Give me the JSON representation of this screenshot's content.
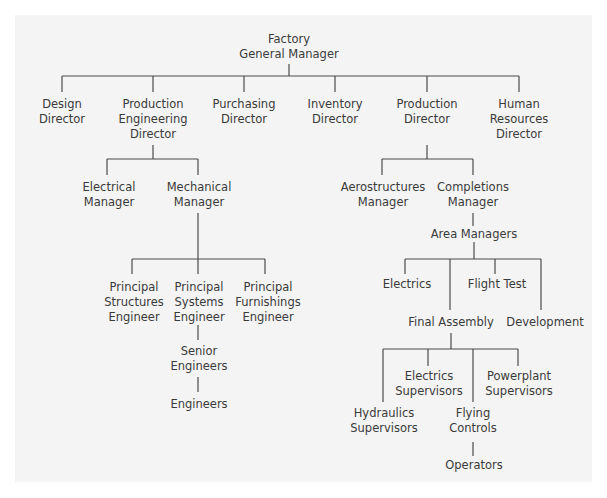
{
  "diagram": {
    "type": "organization-chart",
    "line_color": "#4a4a4a",
    "background_color": "#f4f4f4",
    "nodes": {
      "root": "Factory\nGeneral Manager",
      "design_director": "Design\nDirector",
      "production_engineering_director": "Production\nEngineering\nDirector",
      "purchasing_director": "Purchasing\nDirector",
      "inventory_director": "Inventory\nDirector",
      "production_director": "Production\nDirector",
      "hr_director": "Human\nResources\nDirector",
      "electrical_manager": "Electrical\nManager",
      "mechanical_manager": "Mechanical\nManager",
      "principal_structures": "Principal\nStructures\nEngineer",
      "principal_systems": "Principal\nSystems\nEngineer",
      "principal_furnishings": "Principal\nFurnishings\nEngineer",
      "senior_engineers": "Senior\nEngineers",
      "engineers": "Engineers",
      "aerostructures_manager": "Aerostructures\nManager",
      "completions_manager": "Completions\nManager",
      "area_managers": "Area Managers",
      "electrics": "Electrics",
      "flight_test": "Flight Test",
      "final_assembly": "Final Assembly",
      "development": "Development",
      "electrics_supervisors": "Electrics\nSupervisors",
      "powerplant_supervisors": "Powerplant\nSupervisors",
      "hydraulics_supervisors": "Hydraulics\nSupervisors",
      "flying_controls": "Flying\nControls",
      "operators": "Operators"
    },
    "edges": [
      [
        "root",
        "design_director"
      ],
      [
        "root",
        "production_engineering_director"
      ],
      [
        "root",
        "purchasing_director"
      ],
      [
        "root",
        "inventory_director"
      ],
      [
        "root",
        "production_director"
      ],
      [
        "root",
        "hr_director"
      ],
      [
        "production_engineering_director",
        "electrical_manager"
      ],
      [
        "production_engineering_director",
        "mechanical_manager"
      ],
      [
        "mechanical_manager",
        "principal_structures"
      ],
      [
        "mechanical_manager",
        "principal_systems"
      ],
      [
        "mechanical_manager",
        "principal_furnishings"
      ],
      [
        "principal_systems",
        "senior_engineers"
      ],
      [
        "senior_engineers",
        "engineers"
      ],
      [
        "production_director",
        "aerostructures_manager"
      ],
      [
        "production_director",
        "completions_manager"
      ],
      [
        "completions_manager",
        "area_managers"
      ],
      [
        "area_managers",
        "electrics"
      ],
      [
        "area_managers",
        "final_assembly"
      ],
      [
        "area_managers",
        "flight_test"
      ],
      [
        "area_managers",
        "development"
      ],
      [
        "final_assembly",
        "hydraulics_supervisors"
      ],
      [
        "final_assembly",
        "electrics_supervisors"
      ],
      [
        "final_assembly",
        "flying_controls"
      ],
      [
        "final_assembly",
        "powerplant_supervisors"
      ],
      [
        "flying_controls",
        "operators"
      ]
    ]
  }
}
